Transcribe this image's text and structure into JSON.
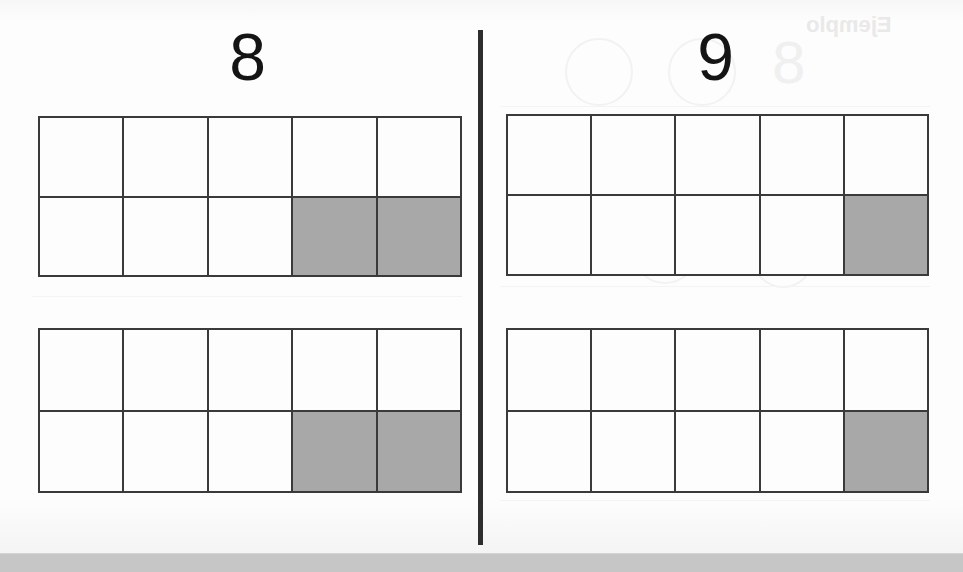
{
  "page": {
    "background_color": "#fcfcfc",
    "width": 963,
    "height": 572
  },
  "divider": {
    "color": "#2e2e2e",
    "orientation": "vertical"
  },
  "panels": [
    {
      "id": "left",
      "heading": "8",
      "frames": [
        {
          "id": "left-frame-top",
          "rows": 2,
          "columns": 5,
          "filled_count": 2,
          "cells": [
            false,
            false,
            false,
            false,
            false,
            false,
            false,
            false,
            true,
            true
          ]
        },
        {
          "id": "left-frame-bottom",
          "rows": 2,
          "columns": 5,
          "filled_count": 2,
          "cells": [
            false,
            false,
            false,
            false,
            false,
            false,
            false,
            false,
            true,
            true
          ]
        }
      ]
    },
    {
      "id": "right",
      "heading": "9",
      "frames": [
        {
          "id": "right-frame-top",
          "rows": 2,
          "columns": 5,
          "filled_count": 1,
          "cells": [
            false,
            false,
            false,
            false,
            false,
            false,
            false,
            false,
            false,
            true
          ]
        },
        {
          "id": "right-frame-bottom",
          "rows": 2,
          "columns": 5,
          "filled_count": 1,
          "cells": [
            false,
            false,
            false,
            false,
            false,
            false,
            false,
            false,
            false,
            true
          ]
        }
      ]
    }
  ],
  "colors": {
    "grid_line": "#3a3a3a",
    "cell_empty": "#fdfdfd",
    "cell_filled": "#a8a8a8",
    "heading_text": "#141414",
    "footer_bar": "#c6c6c6"
  },
  "bleed_through": {
    "note": "faint mirrored show-through from the reverse side of the sheet",
    "word": "Ejemplo",
    "digit": "8"
  },
  "footer": {
    "label": ""
  }
}
